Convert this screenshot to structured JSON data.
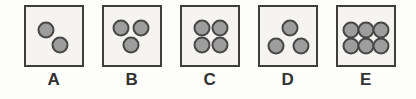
{
  "figure": {
    "type": "dot-pattern-answer-options",
    "colors": {
      "background": "#fdfdfb",
      "box_fill": "#f5f4f0",
      "box_border": "#3e3e3e",
      "dot_fill": "#9d9d9d",
      "dot_border": "#474747",
      "label_color": "#323232"
    },
    "options": [
      {
        "label": "A",
        "dot_count": 2,
        "dots": [
          {
            "x": 36,
            "y": 39
          },
          {
            "x": 61,
            "y": 65
          }
        ]
      },
      {
        "label": "B",
        "dot_count": 3,
        "dots": [
          {
            "x": 30,
            "y": 37
          },
          {
            "x": 66,
            "y": 37
          },
          {
            "x": 48,
            "y": 66
          }
        ]
      },
      {
        "label": "C",
        "dot_count": 4,
        "dots": [
          {
            "x": 36,
            "y": 37
          },
          {
            "x": 67,
            "y": 37
          },
          {
            "x": 36,
            "y": 66
          },
          {
            "x": 67,
            "y": 66
          }
        ]
      },
      {
        "label": "D",
        "dot_count": 3,
        "dots": [
          {
            "x": 53,
            "y": 36
          },
          {
            "x": 29,
            "y": 67
          },
          {
            "x": 73,
            "y": 67
          }
        ]
      },
      {
        "label": "E",
        "dot_count": 6,
        "dots": [
          {
            "x": 24,
            "y": 40
          },
          {
            "x": 50,
            "y": 40
          },
          {
            "x": 76,
            "y": 40
          },
          {
            "x": 24,
            "y": 67
          },
          {
            "x": 50,
            "y": 67
          },
          {
            "x": 76,
            "y": 67
          }
        ]
      }
    ]
  }
}
